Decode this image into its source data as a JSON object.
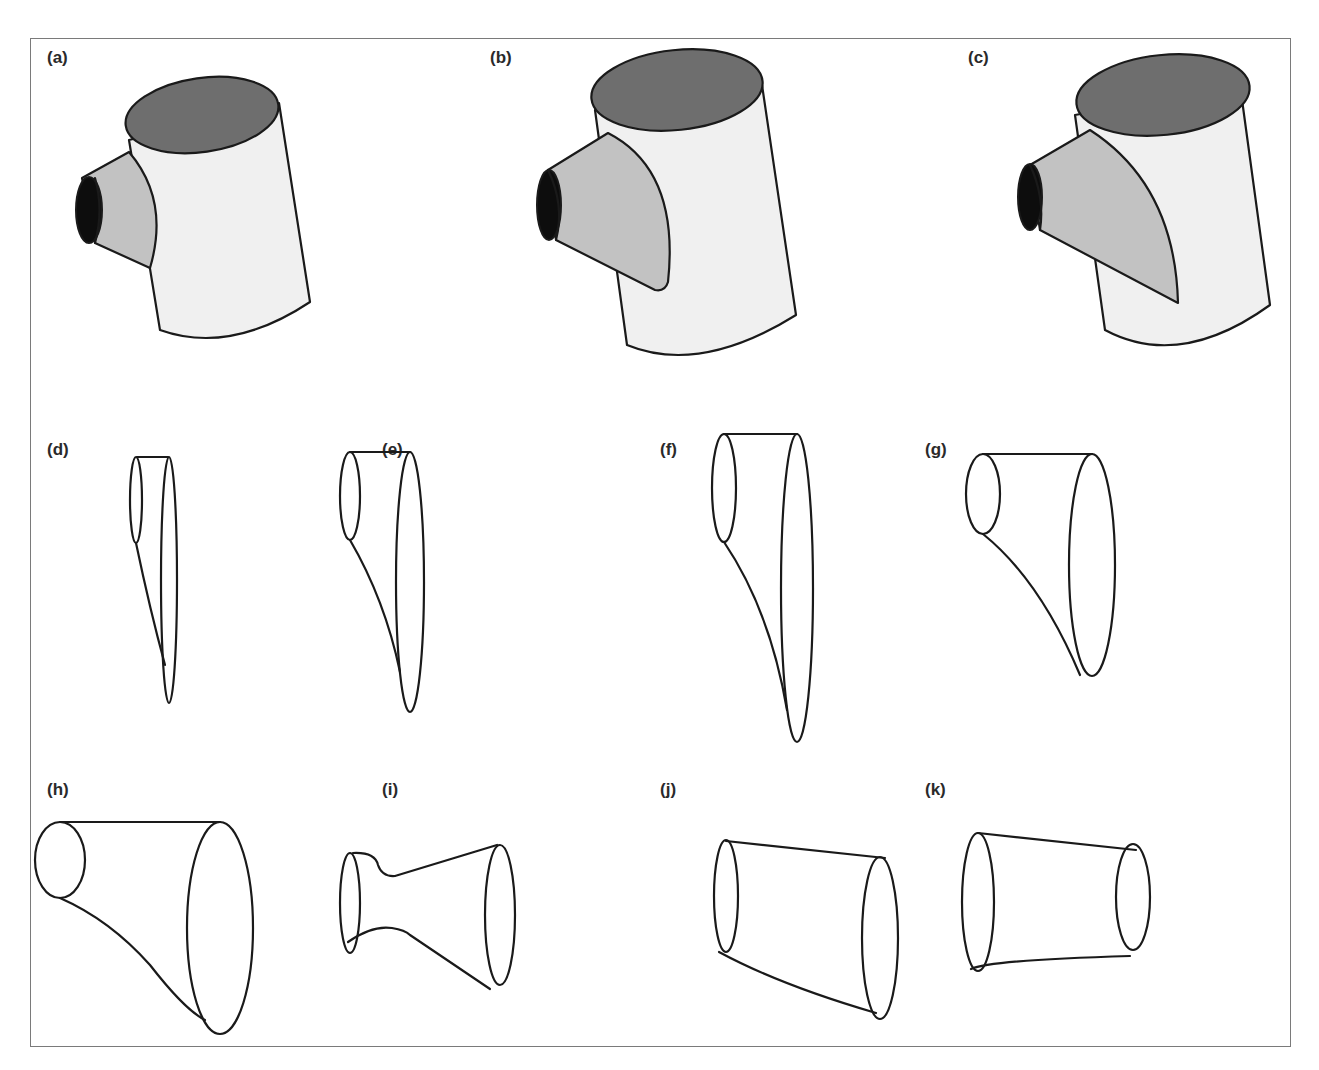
{
  "figure": {
    "panels": [
      {
        "id": "a",
        "label": "(a)",
        "description": "Tee junction: small cylindrical branch intersecting main cylinder"
      },
      {
        "id": "b",
        "label": "(b)",
        "description": "Tee junction: medium conical branch intersecting main cylinder"
      },
      {
        "id": "c",
        "label": "(c)",
        "description": "Tee junction: large conical branch intersecting main cylinder"
      },
      {
        "id": "d",
        "label": "(d)",
        "description": "Transition surface wireframe, narrow"
      },
      {
        "id": "e",
        "label": "(e)",
        "description": "Transition surface wireframe"
      },
      {
        "id": "f",
        "label": "(f)",
        "description": "Transition surface wireframe, tall"
      },
      {
        "id": "g",
        "label": "(g)",
        "description": "Transition surface wireframe, widened"
      },
      {
        "id": "h",
        "label": "(h)",
        "description": "Transition surface wireframe, large cone"
      },
      {
        "id": "i",
        "label": "(i)",
        "description": "Transition surface with waisted profile"
      },
      {
        "id": "j",
        "label": "(j)",
        "description": "Tapered tube, expanding to right"
      },
      {
        "id": "k",
        "label": "(k)",
        "description": "Tapered tube, narrowing to right"
      }
    ],
    "colors": {
      "main_body_fill": "#f0f0f0",
      "top_face_fill": "#6e6e6e",
      "branch_fill": "#c2c2c2",
      "hole_fill": "#0d0d0d",
      "outline": "#1a1a1a",
      "frame_border": "#7a7a7a"
    }
  }
}
